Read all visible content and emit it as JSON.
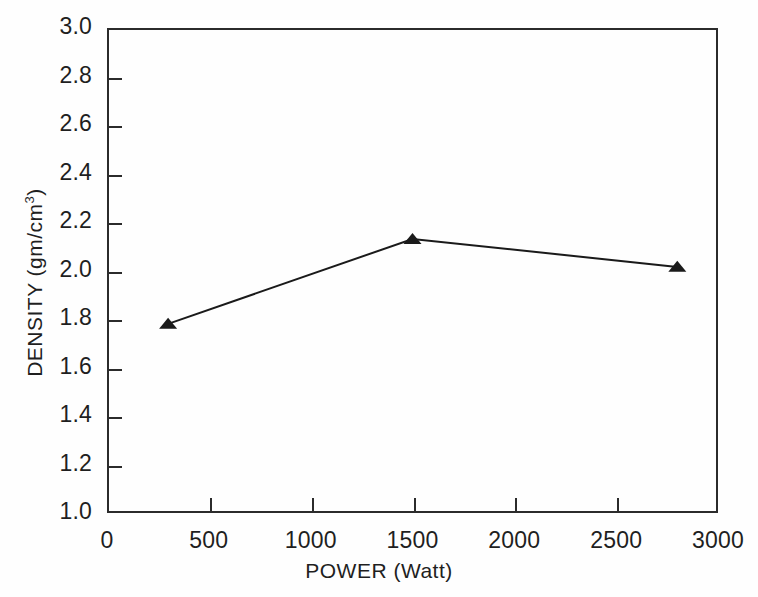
{
  "chart_data": {
    "type": "line",
    "title": "",
    "xlabel": "POWER (Watt)",
    "ylabel": "DENSITY (gm/cm3)",
    "ylabel_display": "DENSITY (gm/cm",
    "ylabel_exponent": "3",
    "ylabel_suffix": ")",
    "xlim": [
      0,
      3000
    ],
    "ylim": [
      1.0,
      3.0
    ],
    "xticks": [
      0,
      500,
      1000,
      1500,
      2000,
      2500,
      3000
    ],
    "xtick_labels": [
      "0",
      "500",
      "1000",
      "1500",
      "2000",
      "2500",
      "3000"
    ],
    "yticks": [
      1.0,
      1.2,
      1.4,
      1.6,
      1.8,
      2.0,
      2.2,
      2.4,
      2.6,
      2.8,
      3.0
    ],
    "ytick_labels": [
      "1.0",
      "1.2",
      "1.4",
      "1.6",
      "1.8",
      "2.0",
      "2.2",
      "2.4",
      "2.6",
      "2.8",
      "3.0"
    ],
    "grid": false,
    "legend": false,
    "marker": "triangle-up",
    "marker_color": "#1a1a1a",
    "line_color": "#1a1a1a",
    "series": [
      {
        "name": "Density vs Power",
        "x": [
          300,
          1500,
          2800
        ],
        "y": [
          1.78,
          2.13,
          2.015
        ]
      }
    ]
  }
}
